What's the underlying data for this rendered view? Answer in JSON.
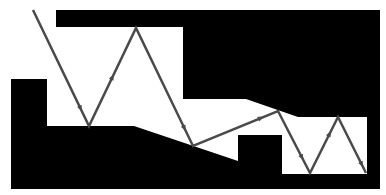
{
  "diagram": {
    "type": "ray-reflection-channel",
    "colors": {
      "background": "#ffffff",
      "walls": "#000000",
      "ray": "#4a4a4a"
    },
    "walls": [
      {
        "name": "top-wall",
        "points": "56,10 380,10 380,99 246,99 298,117 367,117 367,174 282,174 282,135 238,135 238,161 134,126 47,126 47,79 11,79 11,189 380,189 380,10"
      },
      {
        "name": "upper-block",
        "points": "56,10 380,10 380,117 298,117 246,99 183,99 183,27 56,27"
      },
      {
        "name": "lower-block",
        "points": "11,79 47,79 47,126 134,126 238,161 238,135 282,135 282,174 367,174 367,117 380,117 380,189 11,189"
      }
    ],
    "ray_path": [
      [
        33,
        10
      ],
      [
        89,
        126
      ],
      [
        136,
        28
      ],
      [
        193,
        146
      ],
      [
        278,
        111
      ],
      [
        310,
        173
      ],
      [
        338,
        117
      ],
      [
        366,
        173
      ]
    ],
    "arrow_positions": [
      0.85,
      0.5,
      0.85,
      0.8,
      0.75,
      0.7,
      0.85
    ]
  }
}
